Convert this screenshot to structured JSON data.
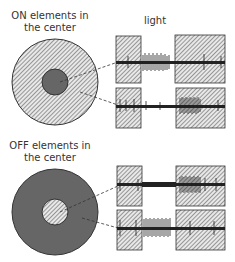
{
  "top_panel": {
    "title_line1": "ON elements in",
    "title_line2": "the center",
    "stimulus_label": "light"
  },
  "bottom_panel": {
    "title_line1": "OFF elements in",
    "title_line2": "the center"
  },
  "colors": {
    "dark_fill": "#666666",
    "hatch_bg": "#e8e8e8",
    "hatch_line": "#444444",
    "spike": "#222222"
  }
}
